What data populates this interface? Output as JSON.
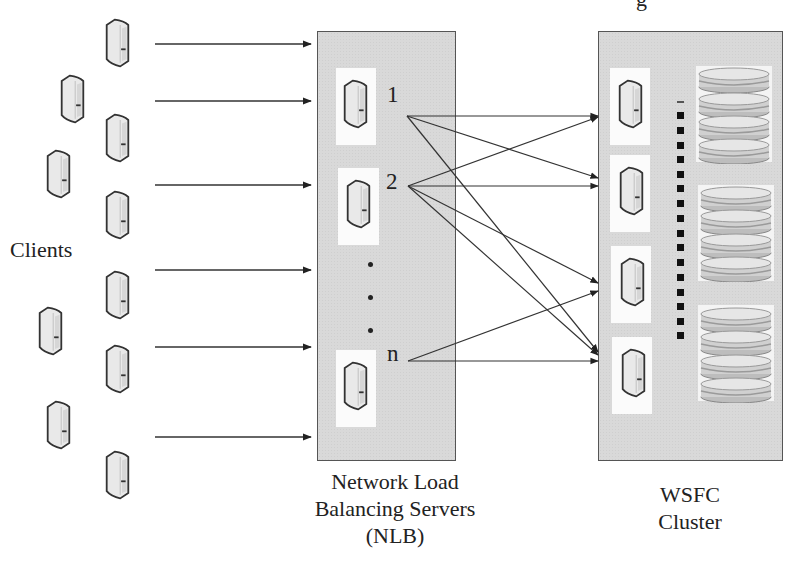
{
  "diagram": {
    "type": "network-architecture",
    "top_fragment": "g",
    "clients": {
      "label": "Clients",
      "count": 10
    },
    "nlb": {
      "label_lines": [
        "Network Load",
        "Balancing Servers",
        "(NLB)"
      ],
      "nodes": [
        {
          "id": "1",
          "label": "1"
        },
        {
          "id": "2",
          "label": "2"
        },
        {
          "id": "n",
          "label": "n"
        }
      ],
      "ellipsis": "..."
    },
    "wsfc": {
      "label_lines": [
        "WSFC",
        "Cluster"
      ],
      "nodes": [
        {
          "id": "w1"
        },
        {
          "id": "w2"
        },
        {
          "id": "w3"
        },
        {
          "id": "w4"
        }
      ],
      "storage_groups": 3,
      "disks_per_group": 2,
      "interconnect": "dashed-bus"
    },
    "edges": {
      "clients_to_nlb": 6,
      "nlb_to_wsfc": [
        {
          "from": "1",
          "to": "w1"
        },
        {
          "from": "1",
          "to": "w2"
        },
        {
          "from": "1",
          "to": "w4"
        },
        {
          "from": "2",
          "to": "w1"
        },
        {
          "from": "2",
          "to": "w2"
        },
        {
          "from": "2",
          "to": "w3"
        },
        {
          "from": "2",
          "to": "w4"
        },
        {
          "from": "n",
          "to": "w3"
        },
        {
          "from": "n",
          "to": "w4"
        }
      ]
    },
    "colors": {
      "panel": "#d9d9d9",
      "panel_border": "#555555",
      "line": "#333333",
      "server_fill": "#e6e6e6",
      "server_stroke": "#333333"
    }
  }
}
